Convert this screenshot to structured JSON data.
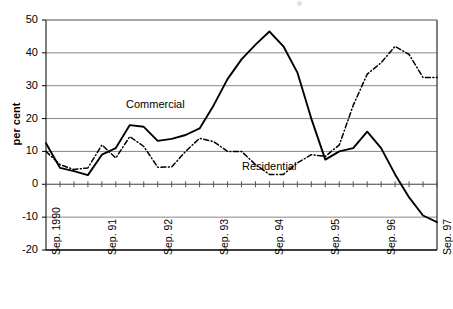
{
  "chart_data": {
    "type": "line",
    "title": "",
    "xlabel": "",
    "ylabel": "per cent",
    "ylim": [
      -20,
      50
    ],
    "ytick_values": [
      50,
      40,
      30,
      20,
      10,
      0,
      -10,
      -20
    ],
    "ytick_labels": [
      "50",
      "40",
      "30",
      "20",
      "10",
      "0",
      "-10",
      "-20"
    ],
    "grid": "horizontal gridlines at each y tick",
    "legend_position": "inline annotations on plot",
    "x_tick_interval": "quarterly",
    "x_major_labels": [
      "Sep. 1990",
      "Sep. 91",
      "Sep. 92",
      "Sep. 93",
      "Sep. 94",
      "Sep. 95",
      "Sep. 96",
      "Sep. 97"
    ],
    "x": [
      "Sep. 1990",
      "Dec. 1990",
      "Mar. 1991",
      "Jun. 1991",
      "Sep. 91",
      "Dec. 1991",
      "Mar. 1992",
      "Jun. 1992",
      "Sep. 92",
      "Dec. 1992",
      "Mar. 1993",
      "Jun. 1993",
      "Sep. 93",
      "Dec. 1993",
      "Mar. 1994",
      "Jun. 1994",
      "Sep. 94",
      "Dec. 1994",
      "Mar. 1995",
      "Jun. 1995",
      "Sep. 95",
      "Dec. 1995",
      "Mar. 1996",
      "Jun. 1996",
      "Sep. 96",
      "Dec. 1996",
      "Mar. 1997",
      "Jun. 1997",
      "Sep. 97"
    ],
    "series": [
      {
        "name": "Commercial",
        "style": "solid",
        "color": "#000000",
        "values": [
          12.5,
          5.0,
          4.0,
          2.8,
          9.0,
          11.0,
          18.0,
          17.5,
          13.2,
          13.8,
          15.0,
          17.0,
          24.0,
          32.0,
          38.0,
          42.5,
          46.5,
          42.0,
          34.0,
          20.0,
          7.5,
          10.0,
          11.0,
          16.0,
          11.0,
          3.0,
          -4.0,
          -9.5,
          -11.5
        ]
      },
      {
        "name": "Residential",
        "style": "dash-dot",
        "color": "#000000",
        "values": [
          10.0,
          6.0,
          4.5,
          5.0,
          12.0,
          8.0,
          14.5,
          11.5,
          5.2,
          5.3,
          10.0,
          14.0,
          13.0,
          10.0,
          10.0,
          6.0,
          3.0,
          3.0,
          6.5,
          9.0,
          8.5,
          12.0,
          24.0,
          33.5,
          37.0,
          42.0,
          39.5,
          32.5,
          32.5
        ]
      }
    ],
    "annotations": [
      {
        "text": "Commercial",
        "x_px": 126,
        "y_px": 98
      },
      {
        "text": "Residential",
        "x_px": 242,
        "y_px": 160
      }
    ]
  },
  "series_labels": {
    "commercial": "Commercial",
    "residential": "Residential"
  }
}
